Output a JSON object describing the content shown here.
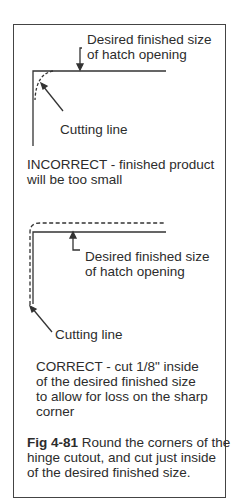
{
  "figure": {
    "incorrect": {
      "label_desired_line1": "Desired finished size",
      "label_desired_line2": "of hatch opening",
      "label_cutting": "Cutting line",
      "caption_line1": "INCORRECT - finished product",
      "caption_line2": "will be too small"
    },
    "correct": {
      "label_desired_line1": "Desired finished size",
      "label_desired_line2": "of hatch opening",
      "label_cutting": "Cutting line",
      "caption_line1": "CORRECT - cut 1/8\" inside",
      "caption_line2": "of the desired finished size",
      "caption_line3": "to allow for loss on the sharp",
      "caption_line4": "corner"
    },
    "caption": {
      "fig_number": "Fig 4-81",
      "line1_rest": " Round the corners of the",
      "line2": "hinge cutout, and cut just inside",
      "line3": "of the desired finished size."
    }
  }
}
